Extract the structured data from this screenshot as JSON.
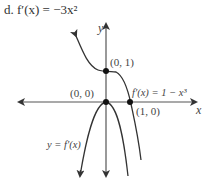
{
  "title": "d. f′(x) = −3x²",
  "axes": {
    "x_label": "x",
    "y_label": "y"
  },
  "points": [
    {
      "label": "(0, 1)",
      "x": 0,
      "y": 1
    },
    {
      "label": "(0, 0)",
      "x": 0,
      "y": 0
    },
    {
      "label": "(1, 0)",
      "x": 1,
      "y": 0
    }
  ],
  "curves": [
    {
      "name": "f",
      "label": "f′(x) = 1 − x³"
    },
    {
      "name": "f-prime",
      "label": "y = f′(x)"
    }
  ],
  "colors": {
    "curve": "#333333",
    "axis": "#444444",
    "text": "#444444"
  }
}
